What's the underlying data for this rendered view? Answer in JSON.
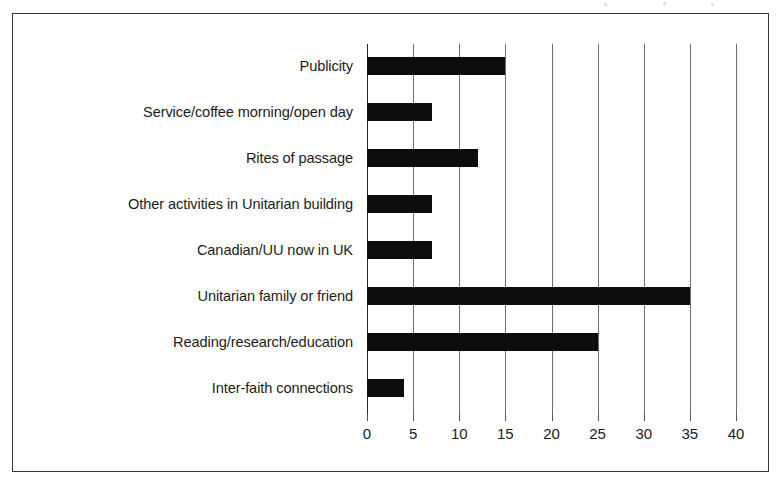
{
  "chart_data": {
    "type": "bar",
    "orientation": "horizontal",
    "title": "",
    "subtitle": "",
    "xlabel": "",
    "ylabel": "",
    "categories": [
      "Publicity",
      "Service/coffee morning/open day",
      "Rites of passage",
      "Other activities in Unitarian building",
      "Canadian/UU now in UK",
      "Unitarian family or friend",
      "Reading/research/education",
      "Inter-faith connections"
    ],
    "values": [
      15,
      7,
      12,
      7,
      7,
      35,
      25,
      4
    ],
    "xticks": [
      0,
      5,
      10,
      15,
      20,
      25,
      30,
      35,
      40
    ],
    "xtick_labels": [
      "0",
      "5",
      "10",
      "15",
      "20",
      "25",
      "30",
      "35",
      "40"
    ],
    "xlim": [
      0,
      40
    ],
    "grid": "vertical",
    "legend": "none",
    "bar_color": "#0d0d0d",
    "gridline_color": "#6e6e6e",
    "axis_color": "#2a2a2a",
    "background_color": "#ffffff",
    "frame_color": "#3a3a3a"
  }
}
